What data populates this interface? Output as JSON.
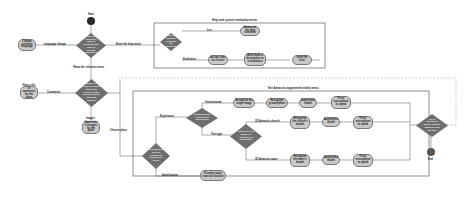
{
  "diagram": {
    "start_label": "Start",
    "end_label": "End",
    "main_decision": "Does the character have a problem with how to change language?",
    "language_change_label": "Language change",
    "change_language_node": "Change previous language",
    "help_menu_label": "Enter the help menu",
    "selection_menu_label": "Show the selection menu",
    "help_frame_title": "Help and system evaluation menu",
    "help_decision": "Help or want to evaluate the system?",
    "help_list_label": "List",
    "help_list_node": "Access to the help searched",
    "help_eval_label": "Evaluation",
    "help_eval_nodes": [
      "Assign stars as a score",
      "Write down a description as a evaluation",
      "Send the form"
    ],
    "selection_decision": "Choose if you want to learn about the chosen place through text or through images",
    "comments_label": "Comments",
    "comments_node": "Have a list of comments for the place",
    "images_label": "Images",
    "images_node": "Have a list of images for the place",
    "chosen_place_label": "Chosen place",
    "ar_frame_title": "See Antarctic augmented reality menu",
    "ar_decision": "Choose the type of element to identify the place",
    "experience_label": "Experience",
    "identification_label": "Identification",
    "identification_node": "Visualize place map and location",
    "info_decision": "Informational or text-type experience",
    "informational_label": "Informational",
    "informational_nodes": [
      "Recognize the target image",
      "Recognize ground plane",
      "Augmented model",
      "Press microphone to speak"
    ],
    "text_type_label": "Text type",
    "text_decision": "Which 3D text model of Antarctic do you want?",
    "antarctic_church_label": "3D Antarctic church",
    "church_nodes": [
      "Recognize the church's facade",
      "Augmented model",
      "Press microphone to speak"
    ],
    "antarctic_tower_label": "3D Antarctic tower",
    "tower_nodes": [
      "Recognize the tower's facade",
      "Augmented model",
      "Press microphone to speak"
    ],
    "final_decision": "Go to selection menu, explore again or exit the app"
  }
}
